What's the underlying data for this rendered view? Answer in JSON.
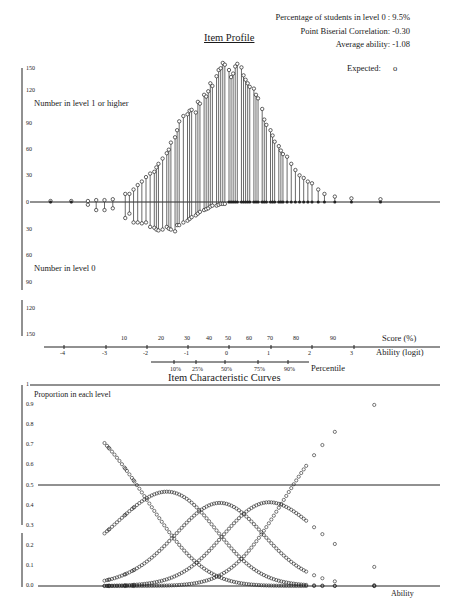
{
  "header": {
    "stats": [
      {
        "label": "Percentage of students in level 0 :",
        "value": "9.5%"
      },
      {
        "label": "Point Biserial Correlation:",
        "value": "-0.30"
      },
      {
        "label": "Average ability:",
        "value": "-1.08"
      }
    ],
    "expected_label": "Expected:",
    "expected_marker": "o"
  },
  "item_profile": {
    "title": "Item Profile",
    "upper_label": "Number in level 1 or higher",
    "lower_label": "Number in level 0",
    "upper_ticks": [
      "150",
      "120",
      "90",
      "60",
      "30"
    ],
    "zero_tick": "0",
    "lower_ticks": [
      "30",
      "60",
      "90",
      "120",
      "150"
    ]
  },
  "axes": {
    "score_label": "Score (%)",
    "score_ticks": [
      {
        "label": "10",
        "x": 125
      },
      {
        "label": "20",
        "x": 162
      },
      {
        "label": "30",
        "x": 188
      },
      {
        "label": "40",
        "x": 210
      },
      {
        "label": "50",
        "x": 229
      },
      {
        "label": "60",
        "x": 250
      },
      {
        "label": "70",
        "x": 271
      },
      {
        "label": "80",
        "x": 297
      },
      {
        "label": "90",
        "x": 334
      }
    ],
    "ability_label": "Ability (logit)",
    "ability_ticks": [
      {
        "label": "-4",
        "x": 64
      },
      {
        "label": "-3",
        "x": 106
      },
      {
        "label": "-2",
        "x": 147
      },
      {
        "label": "-1",
        "x": 188
      },
      {
        "label": "0",
        "x": 229
      },
      {
        "label": "1",
        "x": 271
      },
      {
        "label": "2",
        "x": 312
      },
      {
        "label": "3",
        "x": 354
      }
    ],
    "percentile_label": "Percentile",
    "percentile_ticks": [
      {
        "label": "10%",
        "x": 174
      },
      {
        "label": "25%",
        "x": 196
      },
      {
        "label": "50%",
        "x": 225
      },
      {
        "label": "75%",
        "x": 258
      },
      {
        "label": "90%",
        "x": 288
      }
    ]
  },
  "icc": {
    "title": "Item Characteristic Curves",
    "y_label": "Proportion in each level",
    "x_label": "Ability",
    "y_ticks": [
      "1",
      "0.9",
      "0.8",
      "0.7",
      "0.6",
      "0.5",
      "0.4",
      "0.3",
      "0.2",
      "0.1",
      "0.0"
    ]
  },
  "chart_data": [
    {
      "type": "bar",
      "title": "Item Profile",
      "xlabel": "Ability (logit)",
      "ylabel_upper": "Number in level 1 or higher",
      "ylabel_lower": "Number in level 0",
      "ylim": [
        -150,
        150
      ],
      "x": [
        -4.3,
        -3.8,
        -3.4,
        -3.2,
        -3.0,
        -2.8,
        -2.5,
        -2.4,
        -2.3,
        -2.2,
        -2.1,
        -2.0,
        -1.9,
        -1.8,
        -1.75,
        -1.7,
        -1.6,
        -1.5,
        -1.45,
        -1.4,
        -1.3,
        -1.25,
        -1.2,
        -1.1,
        -1.0,
        -0.95,
        -0.9,
        -0.8,
        -0.75,
        -0.7,
        -0.6,
        -0.55,
        -0.5,
        -0.45,
        -0.4,
        -0.3,
        -0.25,
        -0.2,
        -0.15,
        -0.1,
        0.0,
        0.05,
        0.1,
        0.15,
        0.2,
        0.3,
        0.35,
        0.4,
        0.45,
        0.5,
        0.6,
        0.65,
        0.7,
        0.8,
        0.85,
        0.9,
        1.0,
        1.05,
        1.1,
        1.2,
        1.25,
        1.3,
        1.4,
        1.5,
        1.6,
        1.7,
        1.8,
        1.9,
        2.0,
        2.15,
        2.3,
        2.55,
        2.95,
        3.65
      ],
      "series": [
        {
          "name": "Number in level 1 or higher (observed)",
          "values": [
            0,
            0,
            0,
            1,
            1,
            2,
            8,
            8,
            13,
            18,
            22,
            27,
            31,
            33,
            38,
            42,
            48,
            54,
            58,
            66,
            72,
            80,
            90,
            96,
            98,
            102,
            103,
            100,
            112,
            110,
            120,
            118,
            124,
            133,
            130,
            141,
            148,
            150,
            156,
            154,
            148,
            140,
            144,
            152,
            155,
            151,
            142,
            137,
            133,
            129,
            127,
            120,
            116,
            104,
            92,
            86,
            80,
            74,
            67,
            62,
            57,
            53,
            50,
            42,
            35,
            29,
            26,
            22,
            20,
            13,
            8,
            5,
            3,
            2
          ]
        },
        {
          "name": "Number in level 0 (observed)",
          "values": [
            0,
            0,
            2,
            8,
            8,
            6,
            17,
            12,
            22,
            22,
            23,
            22,
            27,
            28,
            30,
            31,
            30,
            27,
            29,
            30,
            32,
            25,
            25,
            22,
            20,
            18,
            16,
            14,
            12,
            10,
            8,
            7,
            6,
            4,
            3,
            3,
            2,
            1,
            1,
            1,
            0,
            0,
            0,
            0,
            0,
            0,
            0,
            0,
            0,
            0,
            0,
            0,
            0,
            0,
            0,
            0,
            0,
            0,
            0,
            0,
            0,
            0,
            0,
            0,
            0,
            0,
            0,
            0,
            0,
            0,
            0,
            0,
            0,
            0
          ]
        }
      ]
    },
    {
      "type": "scatter",
      "title": "Item Characteristic Curves",
      "xlabel": "Ability",
      "ylabel": "Proportion in each level",
      "ylim": [
        0,
        1
      ],
      "reference_line": 0.5,
      "series": [
        {
          "name": "Level 0",
          "peak": {
            "x": -2.9,
            "y": 0.76
          }
        },
        {
          "name": "Level 1",
          "peak": {
            "x": -1.4,
            "y": 0.41
          }
        },
        {
          "name": "Level 2",
          "peak": {
            "x": -0.3,
            "y": 0.42
          }
        },
        {
          "name": "Level 3",
          "peak": {
            "x": 0.7,
            "y": 0.4
          }
        },
        {
          "name": "Level 4 (cumulative top)",
          "peak": {
            "x": 3.6,
            "y": 0.93
          }
        }
      ]
    }
  ]
}
